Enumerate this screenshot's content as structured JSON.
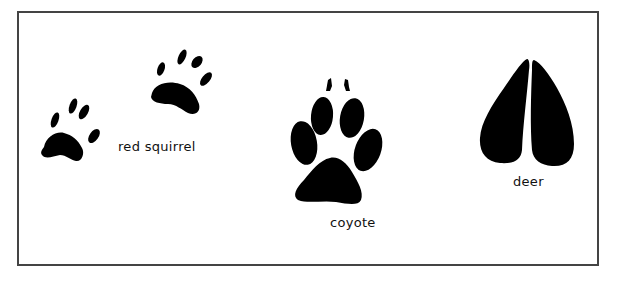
{
  "figure": {
    "border_color": "#444444",
    "ink_color": "#000000",
    "tracks": [
      {
        "id": "red-squirrel",
        "label": "red squirrel",
        "prints": 2
      },
      {
        "id": "coyote",
        "label": "coyote",
        "prints": 1
      },
      {
        "id": "deer",
        "label": "deer",
        "prints": 1
      }
    ]
  }
}
